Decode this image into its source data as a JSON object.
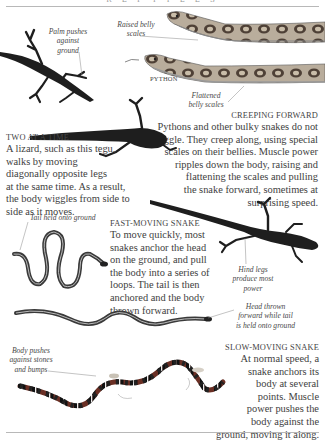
{
  "page": {
    "header": "R E P T I L E S"
  },
  "sections": {
    "creeping_forward": {
      "heading": "Creeping forward",
      "lines": [
        "Pythons and other bulky snakes do not",
        "wriggle. They creep along, using special",
        "scales on their bellies. Muscle power",
        "ripples down the body, raising and",
        "flattening the scales and pulling",
        "the snake forward, sometimes at",
        "surprising speed."
      ]
    },
    "two_at_a_time": {
      "heading": "Two at a time",
      "lines": [
        "A lizard, such as this tegu,",
        "walks by moving",
        "diagonally opposite legs",
        "at the same time. As a result,",
        "the body wiggles from side to",
        "side as it moves."
      ]
    },
    "fast_moving_snake": {
      "heading": "Fast-moving snake",
      "lines": [
        "To move quickly, most",
        "snakes anchor the head",
        "on the ground, and pull",
        "the body into a series of",
        "loops. The tail is then",
        "anchored and the body",
        "thrown forward."
      ]
    },
    "slow_moving_snake": {
      "heading": "Slow-moving snake",
      "lines": [
        "At normal speed, a",
        "snake anchors its",
        "body at several",
        "points. Muscle",
        "power pushes the",
        "body against the",
        "ground, moving it along."
      ]
    }
  },
  "captions": {
    "palm_pushes": [
      "Palm pushes",
      "against",
      "ground"
    ],
    "raised_belly": [
      "Raised belly",
      "scales"
    ],
    "python_label": "Python",
    "flattened_belly": [
      "Flattened",
      "belly scales"
    ],
    "tail_held": "Tail held onto ground",
    "hind_legs": [
      "Hind legs",
      "produce most",
      "power"
    ],
    "head_thrown": [
      "Head thrown",
      "forward while tail",
      "is held onto ground"
    ],
    "body_pushes": [
      "Body pushes",
      "against stones",
      "and bumps"
    ]
  },
  "colors": {
    "text": "#3e3e3e",
    "rule": "#b8b8b8",
    "python_pattern": "#6b5a4a",
    "lizard": "#1e1e1e",
    "coral_red": "#8a3a2a"
  }
}
